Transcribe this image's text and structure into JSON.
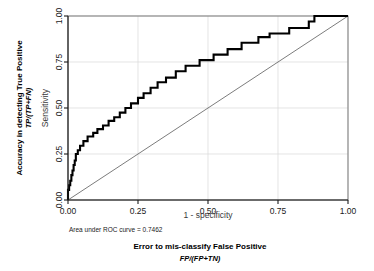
{
  "chart_data": {
    "type": "line",
    "title": "",
    "xlabel": "1 - specificity",
    "ylabel": "Sensitivity",
    "xlim": [
      0,
      1
    ],
    "ylim": [
      0,
      1
    ],
    "grid": true,
    "legend": "none",
    "xticks": [
      "0.00",
      "0.25",
      "0.50",
      "0.75",
      "1.00"
    ],
    "xtick_values": [
      0,
      0.25,
      0.5,
      0.75,
      1
    ],
    "yticks": [
      "0.00",
      "0.25",
      "0.50",
      "0.75",
      "1.00"
    ],
    "ytick_values": [
      0,
      0.25,
      0.5,
      0.75,
      1
    ],
    "annotation": "Area under ROC curve = 0.7462",
    "auc": 0.7462,
    "outer_ylabel_line1": "Accuracy in detecting True Positive",
    "outer_ylabel_line2": "TP/(TP+FN)",
    "outer_xlabel_line1": "Error to mis-classify False Positive",
    "outer_xlabel_line2": "FP/(FP+TN)",
    "series": [
      {
        "name": "ROC curve",
        "style": "step",
        "color": "#000000",
        "x": [
          0.0,
          0.0,
          0.004,
          0.004,
          0.008,
          0.008,
          0.012,
          0.012,
          0.016,
          0.016,
          0.02,
          0.02,
          0.024,
          0.024,
          0.028,
          0.028,
          0.035,
          0.035,
          0.043,
          0.043,
          0.055,
          0.055,
          0.07,
          0.07,
          0.09,
          0.09,
          0.105,
          0.105,
          0.125,
          0.125,
          0.145,
          0.145,
          0.165,
          0.165,
          0.185,
          0.185,
          0.205,
          0.205,
          0.225,
          0.225,
          0.25,
          0.25,
          0.27,
          0.27,
          0.295,
          0.295,
          0.32,
          0.32,
          0.35,
          0.35,
          0.385,
          0.385,
          0.42,
          0.42,
          0.47,
          0.47,
          0.52,
          0.52,
          0.57,
          0.57,
          0.62,
          0.62,
          0.68,
          0.68,
          0.72,
          0.72,
          0.79,
          0.79,
          0.86,
          0.86,
          0.88,
          0.88,
          1.0
        ],
        "y": [
          0.0,
          0.055,
          0.055,
          0.08,
          0.08,
          0.105,
          0.105,
          0.135,
          0.135,
          0.16,
          0.16,
          0.19,
          0.19,
          0.215,
          0.215,
          0.25,
          0.25,
          0.27,
          0.27,
          0.295,
          0.295,
          0.32,
          0.32,
          0.345,
          0.345,
          0.365,
          0.365,
          0.385,
          0.385,
          0.405,
          0.405,
          0.43,
          0.43,
          0.45,
          0.45,
          0.475,
          0.475,
          0.5,
          0.5,
          0.525,
          0.525,
          0.555,
          0.555,
          0.58,
          0.58,
          0.61,
          0.61,
          0.64,
          0.64,
          0.665,
          0.665,
          0.7,
          0.7,
          0.73,
          0.73,
          0.76,
          0.76,
          0.79,
          0.79,
          0.82,
          0.82,
          0.855,
          0.855,
          0.885,
          0.885,
          0.905,
          0.905,
          0.935,
          0.935,
          0.97,
          0.97,
          1.0,
          1.0
        ]
      },
      {
        "name": "reference diagonal",
        "style": "line",
        "color": "#5a5a5a",
        "x": [
          0,
          1
        ],
        "y": [
          0,
          1
        ]
      }
    ]
  }
}
